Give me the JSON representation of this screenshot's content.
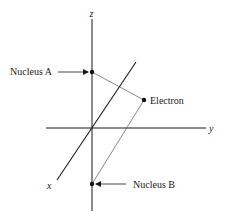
{
  "diagram": {
    "axes": {
      "x_label": "x",
      "y_label": "y",
      "z_label": "z"
    },
    "points": [
      {
        "id": "nucleus-a",
        "label": "Nucleus A",
        "x": 92,
        "y": 72
      },
      {
        "id": "electron",
        "label": "Electron",
        "x": 144,
        "y": 100
      },
      {
        "id": "nucleus-b",
        "label": "Nucleus B",
        "x": 92,
        "y": 184
      }
    ],
    "labels": {
      "nucleus_a": "Nucleus A",
      "electron": "Electron",
      "nucleus_b": "Nucleus B"
    },
    "colors": {
      "axis": "#1a1a1a",
      "connector": "#555555",
      "text": "#1a1a1a"
    }
  }
}
